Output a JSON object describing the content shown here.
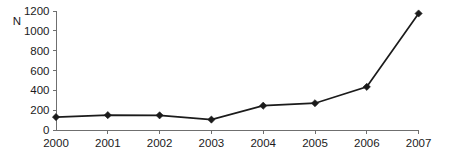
{
  "chart_data": {
    "type": "line",
    "title": "",
    "xlabel": "",
    "ylabel": "N",
    "categories": [
      "2000",
      "2001",
      "2002",
      "2003",
      "2004",
      "2005",
      "2006",
      "2007"
    ],
    "x": [
      2000,
      2001,
      2002,
      2003,
      2004,
      2005,
      2006,
      2007
    ],
    "values": [
      130,
      150,
      148,
      105,
      245,
      270,
      435,
      1175
    ],
    "series": [
      {
        "name": "N",
        "values": [
          130,
          150,
          148,
          105,
          245,
          270,
          435,
          1175
        ]
      }
    ],
    "ylim": [
      0,
      1200
    ],
    "yticks": [
      0,
      200,
      400,
      600,
      800,
      1000,
      1200
    ],
    "ytick_labels": [
      "0",
      "200",
      "400",
      "600",
      "800",
      "1000",
      "1200"
    ],
    "xtick_labels": [
      "2000",
      "2001",
      "2002",
      "2003",
      "2004",
      "2005",
      "2006",
      "2007"
    ],
    "grid": false,
    "legend": false,
    "legend_position": "none",
    "marker": "diamond",
    "line_color": "#1b1b1b",
    "axis_color": "#6f6f6f",
    "background_color": "#ffffff"
  }
}
